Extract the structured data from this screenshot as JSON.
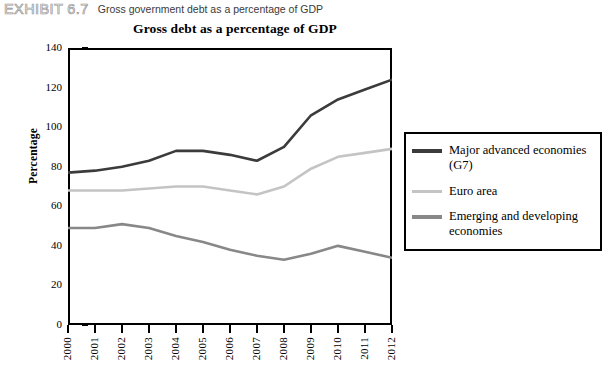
{
  "exhibit": {
    "label": "EXHIBIT 6.7",
    "caption": "Gross government debt as a percentage of GDP"
  },
  "chart_data": {
    "type": "line",
    "title": "Gross debt as a percentage of GDP",
    "xlabel": "",
    "ylabel": "Percentage",
    "xlim": [
      2000,
      2012
    ],
    "ylim": [
      0,
      140
    ],
    "ytick_step": 20,
    "grid": false,
    "legend_position": "right",
    "categories": [
      "2000",
      "2001",
      "2002",
      "2003",
      "2004",
      "2005",
      "2006",
      "2007",
      "2008",
      "2009",
      "2010",
      "2011",
      "2012"
    ],
    "yticks": [
      "0",
      "20",
      "40",
      "60",
      "80",
      "100",
      "120",
      "140"
    ],
    "series": [
      {
        "name": "Major advanced economies (G7)",
        "color": "#3b3b3b",
        "values": [
          77,
          78,
          80,
          83,
          88,
          88,
          86,
          83,
          90,
          106,
          114,
          119,
          124
        ]
      },
      {
        "name": "Euro area",
        "color": "#c4c4c4",
        "values": [
          68,
          68,
          68,
          69,
          70,
          70,
          68,
          66,
          70,
          79,
          85,
          87,
          89
        ]
      },
      {
        "name": "Emerging and developing economies",
        "color": "#888888",
        "values": [
          49,
          49,
          51,
          49,
          45,
          42,
          38,
          35,
          33,
          36,
          40,
          37,
          34
        ]
      }
    ]
  },
  "legend": {
    "items": [
      {
        "label": "Major advanced economies (G7)",
        "color": "#3b3b3b"
      },
      {
        "label": "Euro area",
        "color": "#c4c4c4"
      },
      {
        "label": "Emerging and developing economies",
        "color": "#888888"
      }
    ]
  }
}
